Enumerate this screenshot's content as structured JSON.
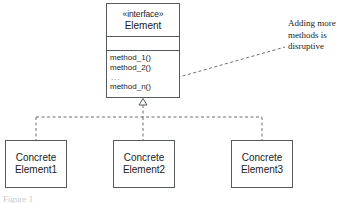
{
  "diagram": {
    "type": "uml-class-diagram",
    "title_caption": "Figure 1",
    "colors": {
      "stroke": "#555a5e",
      "connector": "#6f6f6f",
      "text": "#1b1b1b",
      "background": "#ffffff"
    },
    "interface": {
      "stereotype": "«interface»",
      "name": "Element",
      "attributes": [],
      "methods": [
        "method_1()",
        "method_2()",
        "method_n()"
      ],
      "methods_ellipsis": "..."
    },
    "concrete_classes": [
      {
        "line1": "Concrete",
        "line2": "Element1"
      },
      {
        "line1": "Concrete",
        "line2": "Element2"
      },
      {
        "line1": "Concrete",
        "line2": "Element3"
      }
    ],
    "note": {
      "text": "Adding more methods is disruptive"
    },
    "relationships": {
      "realization_label": "realization",
      "note_anchor_label": "note-anchor"
    }
  }
}
